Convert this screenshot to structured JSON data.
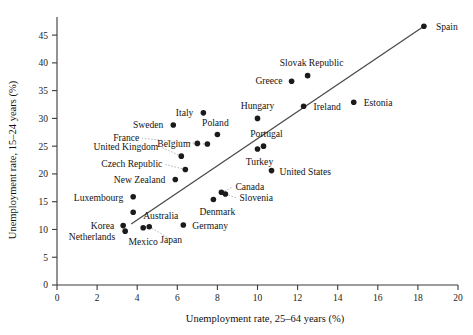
{
  "chart_data": {
    "type": "scatter",
    "title": "",
    "xlabel": "Unemployment rate, 25–64 years (%)",
    "ylabel": "Unemployment rate, 15–24 years (%)",
    "xlim": [
      0,
      20
    ],
    "ylim": [
      0,
      47
    ],
    "xticks": [
      0,
      2,
      4,
      6,
      8,
      10,
      12,
      14,
      16,
      18,
      20
    ],
    "yticks": [
      0,
      5,
      10,
      15,
      20,
      25,
      30,
      35,
      40,
      45
    ],
    "grid": false,
    "legend": null,
    "point_color": "#1b1b1b",
    "line_color": "#4a4a4a",
    "trendline": {
      "x0": 3.7,
      "y0": 11.0,
      "x1": 18.3,
      "y1": 46.6
    },
    "points": [
      {
        "label": "Spain",
        "x": 18.3,
        "y": 46.6,
        "lx": 12,
        "ly": 4,
        "anchor": "start",
        "leader": false
      },
      {
        "label": "Slovak Republic",
        "x": 12.5,
        "y": 37.7,
        "lx": 4,
        "ly": -10,
        "anchor": "middle",
        "leader": false
      },
      {
        "label": "Greece",
        "x": 11.7,
        "y": 36.7,
        "lx": -9,
        "ly": 3,
        "anchor": "end",
        "leader": false
      },
      {
        "label": "Estonia",
        "x": 14.8,
        "y": 32.9,
        "lx": 10,
        "ly": 4,
        "anchor": "start",
        "leader": false
      },
      {
        "label": "Ireland",
        "x": 12.3,
        "y": 32.2,
        "lx": 10,
        "ly": 4,
        "anchor": "start",
        "leader": false
      },
      {
        "label": "Italy",
        "x": 7.3,
        "y": 31.0,
        "lx": -10,
        "ly": 3,
        "anchor": "end",
        "leader": false
      },
      {
        "label": "Hungary",
        "x": 10.0,
        "y": 30.0,
        "lx": 0,
        "ly": -9,
        "anchor": "middle",
        "leader": false
      },
      {
        "label": "Sweden",
        "x": 5.8,
        "y": 28.8,
        "lx": -10,
        "ly": 3,
        "anchor": "end",
        "leader": false
      },
      {
        "label": "Poland",
        "x": 8.0,
        "y": 27.1,
        "lx": -2,
        "ly": -9,
        "anchor": "middle",
        "leader": false
      },
      {
        "label": "France",
        "x": 7.0,
        "y": 25.5,
        "lx": -58,
        "ly": -2,
        "anchor": "end",
        "leader": true
      },
      {
        "label": "Belgium",
        "x": 7.5,
        "y": 25.4,
        "lx": -17,
        "ly": 3,
        "anchor": "end",
        "leader": true
      },
      {
        "label": "Portugal",
        "x": 10.3,
        "y": 25.0,
        "lx": 3,
        "ly": -9,
        "anchor": "middle",
        "leader": false
      },
      {
        "label": "Turkey",
        "x": 10.0,
        "y": 24.5,
        "lx": 2,
        "ly": 16,
        "anchor": "middle",
        "leader": false
      },
      {
        "label": "United Kingdom",
        "x": 6.2,
        "y": 23.2,
        "lx": -23,
        "ly": -6,
        "anchor": "end",
        "leader": true
      },
      {
        "label": "Czech Republic",
        "x": 6.4,
        "y": 20.8,
        "lx": -23,
        "ly": -2,
        "anchor": "end",
        "leader": true
      },
      {
        "label": "United States",
        "x": 10.7,
        "y": 20.6,
        "lx": 8,
        "ly": 4,
        "anchor": "start",
        "leader": false
      },
      {
        "label": "New Zealand",
        "x": 5.9,
        "y": 19.0,
        "lx": -10,
        "ly": 4,
        "anchor": "end",
        "leader": false
      },
      {
        "label": "Canada",
        "x": 8.2,
        "y": 16.7,
        "lx": 14,
        "ly": -2,
        "anchor": "start",
        "leader": true
      },
      {
        "label": "Slovenia",
        "x": 8.4,
        "y": 16.4,
        "lx": 14,
        "ly": 7,
        "anchor": "start",
        "leader": true
      },
      {
        "label": "Luxembourg",
        "x": 3.8,
        "y": 15.9,
        "lx": -10,
        "ly": 4,
        "anchor": "end",
        "leader": false
      },
      {
        "label": "Denmark",
        "x": 7.8,
        "y": 15.4,
        "lx": 4,
        "ly": 16,
        "anchor": "middle",
        "leader": false
      },
      {
        "label": "Australia",
        "x": 3.8,
        "y": 13.1,
        "lx": 10,
        "ly": 7,
        "anchor": "start",
        "leader": false
      },
      {
        "label": "Korea",
        "x": 3.3,
        "y": 10.7,
        "lx": -9,
        "ly": 3,
        "anchor": "end",
        "leader": false
      },
      {
        "label": "Germany",
        "x": 6.3,
        "y": 10.8,
        "lx": 9,
        "ly": 4,
        "anchor": "start",
        "leader": false
      },
      {
        "label": "Mexico",
        "x": 4.3,
        "y": 10.3,
        "lx": 0,
        "ly": 17,
        "anchor": "middle",
        "leader": false
      },
      {
        "label": "Japan",
        "x": 4.6,
        "y": 10.5,
        "lx": 22,
        "ly": 16,
        "anchor": "middle",
        "leader": true
      },
      {
        "label": "Netherlands",
        "x": 3.4,
        "y": 9.7,
        "lx": -10,
        "ly": 9,
        "anchor": "end",
        "leader": false
      }
    ]
  }
}
